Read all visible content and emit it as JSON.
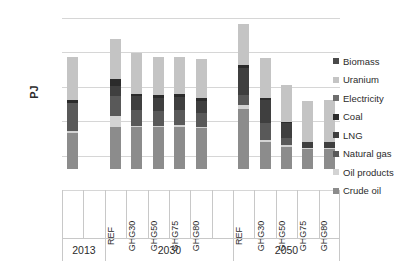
{
  "chart_data": {
    "type": "bar",
    "stacked": true,
    "title": "",
    "xlabel": "",
    "ylabel": "PJ",
    "ylim": [
      -3000,
      22000
    ],
    "yticks": [
      -3000,
      2000,
      7000,
      12000,
      17000,
      22000
    ],
    "ytick_labels": [
      "-3,000",
      "2,000",
      "7,000",
      "12,000",
      "17,000",
      "22,000"
    ],
    "grid": true,
    "legend_position": "right",
    "groups": [
      {
        "year": "2013",
        "scenarios": [
          "",
          ""
        ]
      },
      {
        "year": "2030",
        "scenarios": [
          "REF",
          "GHG30",
          "GHG50",
          "GHG75",
          "GHG80"
        ]
      },
      {
        "year": "2050",
        "scenarios": [
          "REF",
          "GHG30",
          "GHG50",
          "GHG75",
          "GHG80"
        ]
      }
    ],
    "categories": [
      "2013",
      "2030 REF",
      "2030 GHG30",
      "2030 GHG50",
      "2030 GHG75",
      "2030 GHG80",
      "2050 REF",
      "2050 GHG30",
      "2050 GHG50",
      "2050 GHG75",
      "2050 GHG80"
    ],
    "series": [
      {
        "name": "Crude oil",
        "color": "#8c8c8c",
        "values": [
          5300,
          6200,
          6100,
          6100,
          6200,
          6000,
          8800,
          4000,
          3300,
          2900,
          2900
        ]
      },
      {
        "name": "Oil products",
        "color": "#d3d3d3",
        "values": [
          300,
          1500,
          200,
          200,
          200,
          200,
          600,
          200,
          200,
          200,
          200
        ]
      },
      {
        "name": "Natural gas",
        "color": "#595959",
        "values": [
          4100,
          3000,
          2300,
          2200,
          2200,
          2000,
          1400,
          2500,
          1100,
          0,
          0
        ]
      },
      {
        "name": "LNG",
        "color": "#3f3f3f",
        "values": [
          0,
          1400,
          2000,
          1900,
          1900,
          1800,
          4000,
          3400,
          2100,
          900,
          900
        ]
      },
      {
        "name": "Coal",
        "color": "#2b2b2b",
        "values": [
          400,
          1000,
          400,
          400,
          400,
          400,
          400,
          300,
          200,
          0,
          0
        ]
      },
      {
        "name": "Electricity",
        "color": "#6e6e6e",
        "values": [
          0,
          0,
          0,
          0,
          0,
          0,
          0,
          0,
          0,
          0,
          0
        ]
      },
      {
        "name": "Uranium",
        "color": "#c4c4c4",
        "values": [
          6300,
          5900,
          5900,
          5600,
          5400,
          5700,
          5900,
          5800,
          5400,
          6000,
          6100
        ]
      },
      {
        "name": "Biomass",
        "color": "#4a4a4a",
        "values": [
          0,
          0,
          0,
          0,
          0,
          0,
          0,
          0,
          0,
          0,
          0
        ]
      }
    ],
    "totals": [
      16400,
      19000,
      16900,
      16400,
      16300,
      16100,
      21100,
      16200,
      12300,
      10000,
      10100
    ]
  },
  "legend": {
    "items": [
      {
        "label": "Biomass",
        "color": "#4a4a4a"
      },
      {
        "label": "Uranium",
        "color": "#c4c4c4"
      },
      {
        "label": "Electricity",
        "color": "#6e6e6e"
      },
      {
        "label": "Coal",
        "color": "#2b2b2b"
      },
      {
        "label": "LNG",
        "color": "#3f3f3f"
      },
      {
        "label": "Natural gas",
        "color": "#595959"
      },
      {
        "label": "Oil products",
        "color": "#d3d3d3"
      },
      {
        "label": "Crude oil",
        "color": "#8c8c8c"
      }
    ]
  },
  "axis": {
    "y_title": "PJ"
  }
}
